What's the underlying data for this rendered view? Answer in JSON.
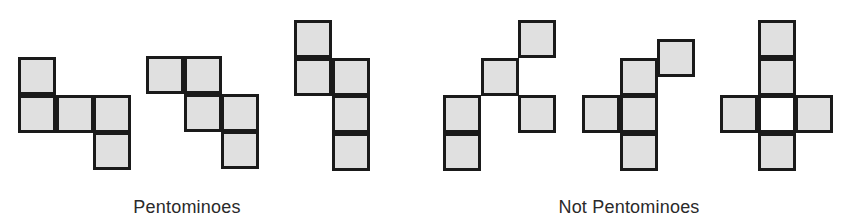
{
  "diagram": {
    "cell_size": 37.5,
    "colors": {
      "fill": "#e0e0e0",
      "stroke": "#1a1a1a",
      "empty": "#ffffff",
      "text": "#2a2a2a"
    },
    "groups": [
      {
        "id": "pentominoes",
        "caption": "Pentominoes",
        "caption_x": 187,
        "caption_y": 197,
        "shapes": [
          {
            "id": "pentomino-1",
            "origin": [
              18,
              57
            ],
            "cells": [
              [
                0,
                0
              ],
              [
                0,
                1
              ],
              [
                1,
                1
              ],
              [
                2,
                1
              ],
              [
                2,
                2
              ]
            ]
          },
          {
            "id": "pentomino-2",
            "origin": [
              146,
              56
            ],
            "cells": [
              [
                0,
                0
              ],
              [
                1,
                0
              ],
              [
                1,
                1
              ],
              [
                2,
                1
              ],
              [
                2,
                2
              ]
            ]
          },
          {
            "id": "pentomino-3",
            "origin": [
              294,
              20
            ],
            "cells": [
              [
                0,
                0
              ],
              [
                0,
                1
              ],
              [
                1,
                1
              ],
              [
                1,
                2
              ],
              [
                1,
                3
              ]
            ]
          }
        ]
      },
      {
        "id": "not-pentominoes",
        "caption": "Not Pentominoes",
        "caption_x": 629,
        "caption_y": 197,
        "shapes": [
          {
            "id": "not-pentomino-1",
            "origin": [
              443,
              20
            ],
            "cells": [
              [
                2,
                0
              ],
              [
                1,
                1
              ],
              [
                0,
                2
              ],
              [
                2,
                2
              ],
              [
                0,
                3
              ]
            ]
          },
          {
            "id": "not-pentomino-2",
            "origin": [
              582,
              20
            ],
            "cells": [
              [
                2,
                0.5
              ],
              [
                1,
                1
              ],
              [
                0,
                2
              ],
              [
                1,
                2
              ],
              [
                1,
                3
              ]
            ]
          },
          {
            "id": "not-pentomino-3",
            "origin": [
              720,
              20
            ],
            "cells": [
              [
                1,
                0
              ],
              [
                1,
                1
              ],
              [
                0,
                2
              ],
              [
                2,
                2
              ],
              [
                1,
                3
              ]
            ],
            "empty_cells": [
              [
                1,
                2
              ]
            ]
          }
        ]
      }
    ]
  }
}
